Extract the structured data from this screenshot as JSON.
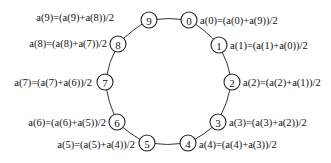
{
  "diagram": {
    "type": "ring",
    "center": {
      "x": 168,
      "y": 82
    },
    "node_radius": 8,
    "colors": {
      "stroke": "#222222",
      "edge": "#333333",
      "text": "#111111",
      "background": "#ffffff"
    },
    "nodes": [
      {
        "id": "0",
        "label": "0",
        "x": 189,
        "y": 20,
        "formula": "a(0)=(a(0)+a(9))/2",
        "fx": 200,
        "fy": 20,
        "anchor": "start"
      },
      {
        "id": "1",
        "label": "1",
        "x": 219,
        "y": 45,
        "formula": "a(1)=(a(1)+a(0))/2",
        "fx": 230,
        "fy": 45,
        "anchor": "start"
      },
      {
        "id": "2",
        "label": "2",
        "x": 232,
        "y": 82,
        "formula": "a(2)=(a(2)+a(1))/2",
        "fx": 243,
        "fy": 82,
        "anchor": "start"
      },
      {
        "id": "3",
        "label": "3",
        "x": 218,
        "y": 122,
        "formula": "a(3)=(a(3)+a(2))/2",
        "fx": 229,
        "fy": 122,
        "anchor": "start"
      },
      {
        "id": "4",
        "label": "4",
        "x": 188,
        "y": 143,
        "formula": "a(4)=(a(4)+a(3))/2",
        "fx": 199,
        "fy": 144,
        "anchor": "start"
      },
      {
        "id": "5",
        "label": "5",
        "x": 147,
        "y": 143,
        "formula": "a(5)=(a(5)+a(4))/2",
        "fx": 135,
        "fy": 144,
        "anchor": "end"
      },
      {
        "id": "6",
        "label": "6",
        "x": 117,
        "y": 122,
        "formula": "a(6)=(a(6)+a(5))/2",
        "fx": 106,
        "fy": 122,
        "anchor": "end"
      },
      {
        "id": "7",
        "label": "7",
        "x": 105,
        "y": 82,
        "formula": "a(7)=(a(7)+a(6))/2",
        "fx": 92,
        "fy": 82,
        "anchor": "end"
      },
      {
        "id": "8",
        "label": "8",
        "x": 118,
        "y": 44,
        "formula": "a(8)=(a(8)+a(7))/2",
        "fx": 107,
        "fy": 43,
        "anchor": "end"
      },
      {
        "id": "9",
        "label": "9",
        "x": 149,
        "y": 20,
        "formula": "a(9)=(a(9)+a(8))/2",
        "fx": 114,
        "fy": 17,
        "anchor": "end"
      }
    ],
    "edges": [
      [
        "9",
        "0"
      ],
      [
        "0",
        "1"
      ],
      [
        "1",
        "2"
      ],
      [
        "2",
        "3"
      ],
      [
        "3",
        "4"
      ],
      [
        "4",
        "5"
      ],
      [
        "5",
        "6"
      ],
      [
        "6",
        "7"
      ],
      [
        "7",
        "8"
      ],
      [
        "8",
        "9"
      ]
    ]
  }
}
